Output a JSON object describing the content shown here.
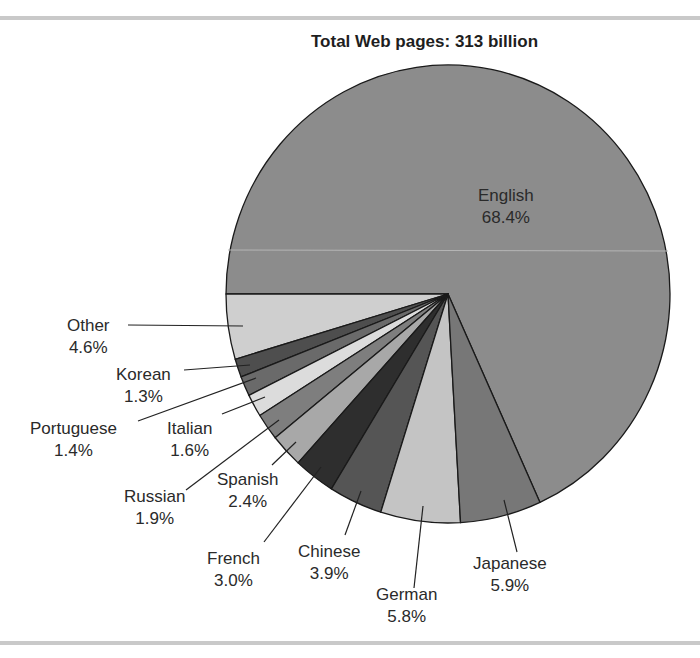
{
  "chart_data": {
    "type": "pie",
    "title": "Total Web pages: 313 billion",
    "slices": [
      {
        "label": "English",
        "value": 68.4,
        "display": "68.4%",
        "color": "#8c8c8c"
      },
      {
        "label": "Japanese",
        "value": 5.9,
        "display": "5.9%",
        "color": "#777777"
      },
      {
        "label": "German",
        "value": 5.8,
        "display": "5.8%",
        "color": "#c4c4c4"
      },
      {
        "label": "Chinese",
        "value": 3.9,
        "display": "3.9%",
        "color": "#555555"
      },
      {
        "label": "French",
        "value": 3.0,
        "display": "3.0%",
        "color": "#2e2e2e"
      },
      {
        "label": "Spanish",
        "value": 2.4,
        "display": "2.4%",
        "color": "#a8a8a8"
      },
      {
        "label": "Russian",
        "value": 1.9,
        "display": "1.9%",
        "color": "#7e7e7e"
      },
      {
        "label": "Italian",
        "value": 1.6,
        "display": "1.6%",
        "color": "#dcdcdc"
      },
      {
        "label": "Portuguese",
        "value": 1.4,
        "display": "1.4%",
        "color": "#6a6a6a"
      },
      {
        "label": "Korean",
        "value": 1.3,
        "display": "1.3%",
        "color": "#4e4e4e"
      },
      {
        "label": "Other",
        "value": 4.6,
        "display": "4.6%",
        "color": "#cfcfcf"
      }
    ],
    "total_label": "313 billion",
    "legend": "none (callout labels)"
  }
}
